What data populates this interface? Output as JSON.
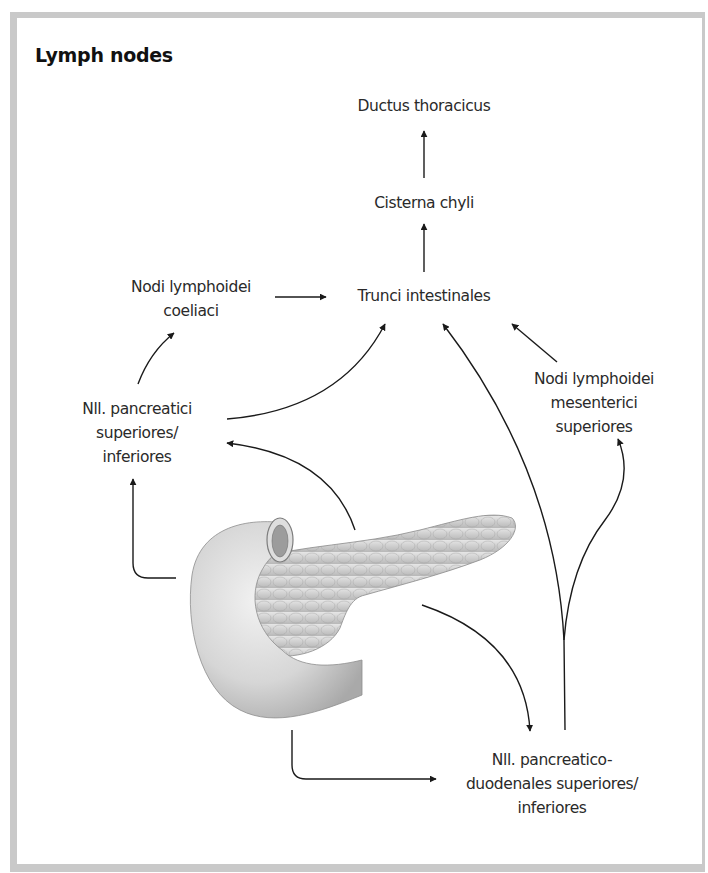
{
  "title": "Lymph nodes",
  "nodes": {
    "ductus_thoracicus": {
      "lines": [
        "Ductus thoracicus"
      ]
    },
    "cisterna_chyli": {
      "lines": [
        "Cisterna chyli"
      ]
    },
    "trunci_intestinales": {
      "lines": [
        "Trunci intestinales"
      ]
    },
    "nodi_coeliaci": {
      "lines": [
        "Nodi lymphoidei",
        "coeliaci"
      ]
    },
    "nll_pancreatici": {
      "lines": [
        "Nll. pancreatici",
        "superiores/",
        "inferiores"
      ]
    },
    "nodi_mesenterici": {
      "lines": [
        "Nodi lymphoidei",
        "mesenterici",
        "superiores"
      ]
    },
    "nll_pancreaticoduodenales": {
      "lines": [
        "Nll. pancreatico-",
        "duodenales superiores/",
        "inferiores"
      ]
    }
  },
  "illustration": {
    "subject": "pancreas-with-duodenum"
  },
  "flows": [
    {
      "from": "cisterna_chyli",
      "to": "ductus_thoracicus"
    },
    {
      "from": "trunci_intestinales",
      "to": "cisterna_chyli"
    },
    {
      "from": "nodi_coeliaci",
      "to": "trunci_intestinales"
    },
    {
      "from": "nll_pancreatici",
      "to": "nodi_coeliaci"
    },
    {
      "from": "nll_pancreatici",
      "to": "trunci_intestinales"
    },
    {
      "from": "nodi_mesenterici",
      "to": "trunci_intestinales"
    },
    {
      "from": "pancreas",
      "to": "nll_pancreatici"
    },
    {
      "from": "pancreas",
      "to": "nll_pancreaticoduodenales"
    },
    {
      "from": "nll_pancreaticoduodenales",
      "to": "trunci_intestinales"
    },
    {
      "from": "nll_pancreaticoduodenales",
      "to": "nodi_mesenterici"
    }
  ],
  "colors": {
    "frame": "#c9c9c9",
    "text": "#2a2a2a",
    "arrow": "#1a1a1a"
  }
}
